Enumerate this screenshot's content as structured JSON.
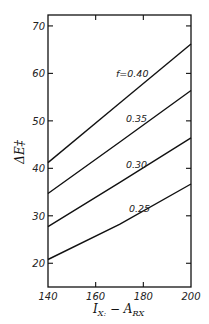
{
  "chart_data": {
    "type": "line",
    "title": "",
    "xlabel": "I_X: − A_RX",
    "ylabel": "ΔE‡",
    "xlim": [
      140,
      200
    ],
    "ylim": [
      15,
      72.3
    ],
    "xticks": [
      140,
      160,
      180,
      200
    ],
    "yticks": [
      20,
      30,
      40,
      50,
      60,
      70
    ],
    "grid": false,
    "legend": "inline curve labels",
    "series": [
      {
        "name": "f = 0.40",
        "label": "f=0.40",
        "x": [
          140,
          170,
          200
        ],
        "y": [
          41.2,
          53.7,
          66.2
        ]
      },
      {
        "name": "f = 0.35",
        "label": "0.35",
        "x": [
          140,
          170,
          200
        ],
        "y": [
          34.7,
          45.5,
          56.4
        ]
      },
      {
        "name": "f = 0.30",
        "label": "0.30",
        "x": [
          140,
          170,
          200
        ],
        "y": [
          27.7,
          37.0,
          46.4
        ]
      },
      {
        "name": "f = 0.25",
        "label": "0.25",
        "x": [
          140,
          170,
          200
        ],
        "y": [
          20.8,
          28.2,
          36.7
        ]
      }
    ]
  },
  "axes": {
    "x_title_main": "I",
    "x_title_sub1": "X:",
    "x_title_minus": " − A",
    "x_title_sub2": "RX",
    "y_title": "ΔE‡"
  }
}
